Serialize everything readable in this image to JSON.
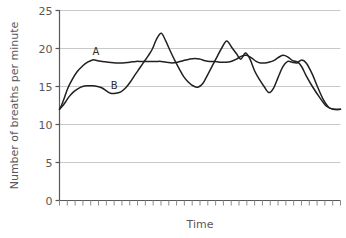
{
  "chart_data": {
    "type": "line",
    "title": "",
    "xlabel": "Time",
    "ylabel": "Number of breaths per minute",
    "ylim": [
      0,
      25
    ],
    "yticks": [
      0,
      5,
      10,
      15,
      20,
      25
    ],
    "ytick_labels": [
      "0",
      "5",
      "10",
      "15",
      "20",
      "25"
    ],
    "xticks_count": 36,
    "xtick_labels": [],
    "grid": "horizontal",
    "legend_position": "inline-annotation",
    "annotations": [
      {
        "label": "A",
        "x_frac": 0.13,
        "value": 18.6
      },
      {
        "label": "B",
        "x_frac": 0.195,
        "value": 14.1
      }
    ],
    "series": [
      {
        "name": "A",
        "color": "#231f20",
        "x": [
          0.0,
          0.008,
          0.018,
          0.03,
          0.045,
          0.062,
          0.082,
          0.1,
          0.118,
          0.135,
          0.152,
          0.175,
          0.2,
          0.225,
          0.25,
          0.272,
          0.29,
          0.305,
          0.318,
          0.33,
          0.345,
          0.362,
          0.382,
          0.4,
          0.42,
          0.44,
          0.462,
          0.482,
          0.5,
          0.518,
          0.535,
          0.552,
          0.57,
          0.59,
          0.61,
          0.63,
          0.648,
          0.665,
          0.682,
          0.7,
          0.715,
          0.73,
          0.745,
          0.762,
          0.778,
          0.795,
          0.812,
          0.83,
          0.848,
          0.862,
          0.878,
          0.9,
          0.925,
          0.95,
          0.975,
          1.0
        ],
        "values": [
          12.0,
          12.6,
          13.6,
          14.8,
          15.9,
          16.9,
          17.7,
          18.2,
          18.5,
          18.4,
          18.3,
          18.2,
          18.1,
          18.1,
          18.2,
          18.3,
          18.3,
          18.3,
          18.3,
          18.3,
          18.3,
          18.3,
          18.2,
          18.1,
          18.2,
          18.4,
          18.6,
          18.7,
          18.6,
          18.4,
          18.3,
          18.3,
          18.2,
          18.2,
          18.3,
          18.6,
          19.0,
          19.1,
          18.8,
          18.3,
          18.1,
          18.1,
          18.2,
          18.4,
          18.8,
          19.1,
          18.9,
          18.4,
          18.2,
          17.6,
          16.4,
          15.0,
          13.6,
          12.4,
          12.0,
          12.0
        ]
      },
      {
        "name": "B",
        "color": "#231f20",
        "x": [
          0.0,
          0.01,
          0.022,
          0.035,
          0.05,
          0.065,
          0.082,
          0.1,
          0.118,
          0.135,
          0.152,
          0.168,
          0.182,
          0.2,
          0.218,
          0.235,
          0.252,
          0.268,
          0.285,
          0.3,
          0.315,
          0.33,
          0.345,
          0.362,
          0.378,
          0.395,
          0.412,
          0.428,
          0.442,
          0.458,
          0.475,
          0.492,
          0.51,
          0.528,
          0.545,
          0.562,
          0.578,
          0.595,
          0.612,
          0.63,
          0.645,
          0.662,
          0.678,
          0.695,
          0.712,
          0.728,
          0.745,
          0.762,
          0.778,
          0.795,
          0.812,
          0.828,
          0.845,
          0.862,
          0.878,
          0.9,
          0.92,
          0.94,
          0.96,
          0.98,
          1.0
        ],
        "values": [
          12.0,
          12.4,
          13.0,
          13.7,
          14.3,
          14.7,
          15.0,
          15.1,
          15.1,
          15.0,
          14.8,
          14.4,
          14.1,
          14.1,
          14.3,
          14.8,
          15.6,
          16.5,
          17.4,
          18.2,
          19.0,
          19.9,
          21.2,
          22.0,
          21.0,
          19.6,
          18.3,
          17.2,
          16.3,
          15.6,
          15.1,
          14.9,
          15.4,
          16.6,
          17.8,
          19.0,
          20.1,
          21.0,
          20.2,
          19.3,
          18.6,
          19.4,
          18.6,
          17.0,
          15.9,
          15.0,
          14.2,
          14.8,
          16.2,
          17.6,
          18.3,
          18.2,
          18.1,
          18.5,
          18.1,
          16.6,
          14.8,
          13.2,
          12.2,
          12.0,
          12.0
        ]
      }
    ]
  },
  "axes": {
    "y_title": "Number of breaths per minute",
    "x_title": "Time"
  }
}
